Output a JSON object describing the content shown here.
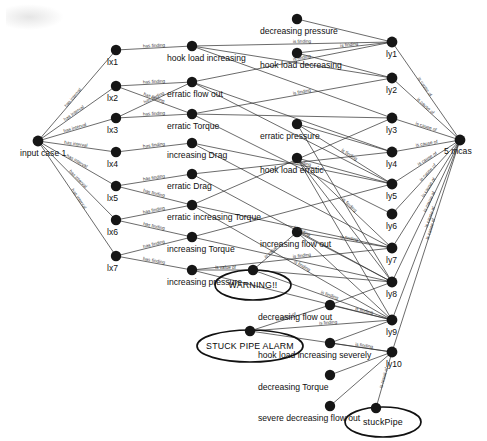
{
  "diagram": {
    "type": "node-link-graph",
    "edge_relations": {
      "has_interval": "has interval",
      "has_finding": "has finding",
      "is_finding": "is finding",
      "is_value_of": "is value of",
      "is_cause_of": "is cause of",
      "is_result_of": "is result of"
    },
    "colors": {
      "node": "#161616",
      "edge": "#2b2b2b",
      "ellipse": "#111111",
      "background": "#ffffff"
    },
    "nodes": {
      "input": {
        "id": "input-case",
        "label": "input case 1",
        "x": 38,
        "y": 141
      },
      "intervals": [
        {
          "id": "lx1",
          "label": "lx1",
          "x": 116,
          "y": 50
        },
        {
          "id": "lx2",
          "label": "lx2",
          "x": 116,
          "y": 86
        },
        {
          "id": "lx3",
          "label": "lx3",
          "x": 116,
          "y": 118
        },
        {
          "id": "lx4",
          "label": "lx4",
          "x": 116,
          "y": 152
        },
        {
          "id": "lx5",
          "label": "lx5",
          "x": 116,
          "y": 186
        },
        {
          "id": "lx6",
          "label": "lx6",
          "x": 116,
          "y": 220
        },
        {
          "id": "lx7",
          "label": "lx7",
          "x": 116,
          "y": 256
        }
      ],
      "findings_left": [
        {
          "id": "f1",
          "label": "hook load increasing",
          "x": 192,
          "y": 46
        },
        {
          "id": "f2",
          "label": "erratic flow out",
          "x": 192,
          "y": 82
        },
        {
          "id": "f3",
          "label": "erratic Torque",
          "x": 192,
          "y": 114
        },
        {
          "id": "f4",
          "label": "increasing Drag",
          "x": 192,
          "y": 143
        },
        {
          "id": "f5",
          "label": "erratic Drag",
          "x": 192,
          "y": 174
        },
        {
          "id": "f6",
          "label": "erratic increasing  Torque",
          "x": 192,
          "y": 205
        },
        {
          "id": "f7",
          "label": "increasing Torque",
          "x": 192,
          "y": 237
        },
        {
          "id": "f8",
          "label": "increasing pressure",
          "x": 192,
          "y": 270
        }
      ],
      "findings_right": [
        {
          "id": "g1",
          "label": "decreasing pressure",
          "x": 297,
          "y": 19
        },
        {
          "id": "g2",
          "label": "hook load decreasing",
          "x": 297,
          "y": 53
        },
        {
          "id": "g3",
          "label": "erratic pressure",
          "x": 297,
          "y": 124
        },
        {
          "id": "g4",
          "label": "hook load erratic",
          "x": 297,
          "y": 158
        },
        {
          "id": "g5",
          "label": "increasing flow out",
          "x": 297,
          "y": 232
        }
      ],
      "findings_bottom": [
        {
          "id": "b1",
          "label": "decreasing flow out",
          "x": 330,
          "y": 305
        },
        {
          "id": "b2",
          "label": "hook load increasing severely",
          "x": 330,
          "y": 343
        },
        {
          "id": "b3",
          "label": "decreasing Torque",
          "x": 330,
          "y": 375
        },
        {
          "id": "b4",
          "label": "severe decreasing flow out",
          "x": 330,
          "y": 406
        }
      ],
      "results": [
        {
          "id": "ly1",
          "label": "ly1",
          "x": 392,
          "y": 42
        },
        {
          "id": "ly2",
          "label": "ly2",
          "x": 392,
          "y": 78
        },
        {
          "id": "ly3",
          "label": "ly3",
          "x": 392,
          "y": 118
        },
        {
          "id": "ly4",
          "label": "ly4",
          "x": 392,
          "y": 152
        },
        {
          "id": "ly5",
          "label": "ly5",
          "x": 392,
          "y": 184
        },
        {
          "id": "ly6",
          "label": "ly6",
          "x": 392,
          "y": 214
        },
        {
          "id": "ly7",
          "label": "ly7",
          "x": 392,
          "y": 248
        },
        {
          "id": "ly8",
          "label": "ly8",
          "x": 392,
          "y": 282
        },
        {
          "id": "ly9",
          "label": "ly9",
          "x": 392,
          "y": 320
        },
        {
          "id": "ly10",
          "label": "ly10",
          "x": 392,
          "y": 352
        }
      ],
      "cause": {
        "id": "5-mcas",
        "label": "5 mcas",
        "x": 460,
        "y": 140
      }
    },
    "ellipse_nodes": [
      {
        "id": "warning",
        "label": "WARNING!!",
        "cx": 253,
        "cy": 285,
        "rx": 38,
        "ry": 15,
        "dot_x": 253,
        "dot_y": 270
      },
      {
        "id": "stuck-pipe-alarm",
        "label": "STUCK PIPE ALARM",
        "cx": 250,
        "cy": 346,
        "rx": 53,
        "ry": 16,
        "dot_x": 250,
        "dot_y": 331
      },
      {
        "id": "stuck-pipe",
        "label": "stuckPipe",
        "cx": 383,
        "cy": 422,
        "rx": 38,
        "ry": 15,
        "dot_x": 376,
        "dot_y": 408
      }
    ]
  }
}
